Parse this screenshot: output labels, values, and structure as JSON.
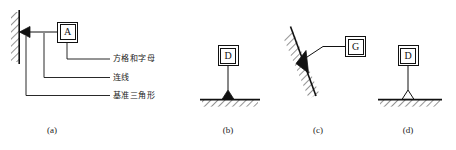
{
  "figure": {
    "type": "engineering-drawing",
    "stroke_color": "#111111",
    "fill_color": "#111111",
    "background_color": "#ffffff"
  },
  "panels": [
    {
      "id": "a",
      "caption": "(a)",
      "symbol_letter": "A",
      "surface": "vertical-hatched-wall",
      "triangle_fill": "solid",
      "leader": "horizontal",
      "callouts": [
        {
          "key": "box_and_letter",
          "label": "方格和字母"
        },
        {
          "key": "connecting_line",
          "label": "连线"
        },
        {
          "key": "datum_triangle",
          "label": "基准三角形"
        }
      ]
    },
    {
      "id": "b",
      "caption": "(b)",
      "symbol_letter": "D",
      "surface": "horizontal-hatched-surface",
      "triangle_fill": "solid",
      "leader": "vertical"
    },
    {
      "id": "c",
      "caption": "(c)",
      "symbol_letter": "G",
      "surface": "inclined-hatched-surface",
      "triangle_fill": "solid",
      "leader": "bent-diagonal"
    },
    {
      "id": "d",
      "caption": "(d)",
      "symbol_letter": "D",
      "surface": "horizontal-hatched-surface",
      "triangle_fill": "hollow",
      "leader": "vertical"
    }
  ]
}
